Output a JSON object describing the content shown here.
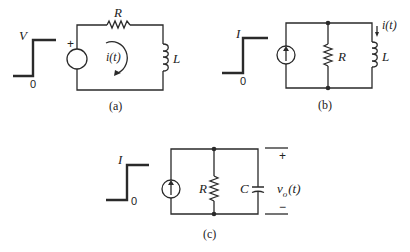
{
  "figure": {
    "circuits": [
      {
        "id": "a",
        "caption": "(a)",
        "input_step": {
          "level_label": "V",
          "origin_label": "0"
        },
        "source": {
          "type": "voltage-source",
          "polarity_label": "+"
        },
        "components": [
          {
            "type": "resistor",
            "label": "R",
            "position": "series-top"
          },
          {
            "type": "inductor",
            "label": "L",
            "position": "series-right"
          }
        ],
        "annotations": {
          "loop_current": "i(t)"
        }
      },
      {
        "id": "b",
        "caption": "(b)",
        "input_step": {
          "level_label": "I",
          "origin_label": "0"
        },
        "source": {
          "type": "current-source",
          "direction": "up"
        },
        "components": [
          {
            "type": "resistor",
            "label": "R",
            "position": "parallel"
          },
          {
            "type": "inductor",
            "label": "L",
            "position": "parallel"
          }
        ],
        "annotations": {
          "branch_current": "i(t)"
        }
      },
      {
        "id": "c",
        "caption": "(c)",
        "input_step": {
          "level_label": "I",
          "origin_label": "0"
        },
        "source": {
          "type": "current-source",
          "direction": "up"
        },
        "components": [
          {
            "type": "resistor",
            "label": "R",
            "position": "parallel"
          },
          {
            "type": "capacitor",
            "label": "C",
            "position": "parallel"
          }
        ],
        "annotations": {
          "output_voltage": "v",
          "output_subscript": "o",
          "output_arg": "(t)",
          "plus": "+",
          "minus": "−"
        }
      }
    ]
  }
}
